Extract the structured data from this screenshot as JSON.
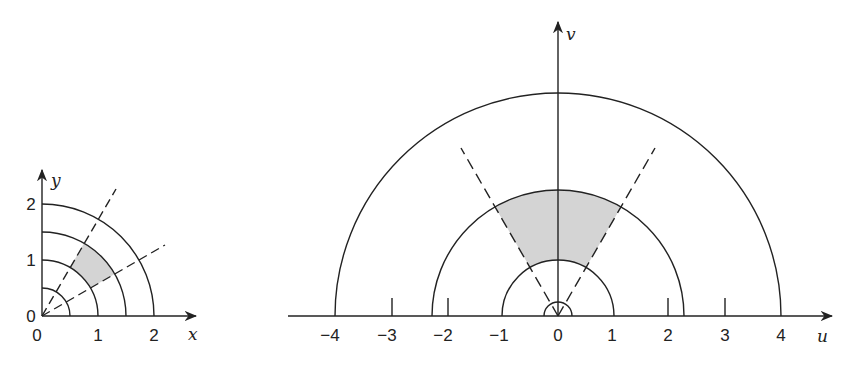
{
  "left_figure": {
    "x_axis_label": "x",
    "y_axis_label": "y",
    "x_ticks": [
      "0",
      "1",
      "2"
    ],
    "y_ticks": [
      "0",
      "1",
      "2"
    ],
    "circle_radii": [
      0.5,
      1,
      1.5,
      2
    ],
    "dashed_ray_angles_deg": [
      30,
      60
    ],
    "shaded_region": {
      "r_min": 1,
      "r_max": 1.5,
      "theta_min_deg": 30,
      "theta_max_deg": 60
    }
  },
  "right_figure": {
    "x_axis_label": "u",
    "y_axis_label": "v",
    "x_ticks": [
      "−4",
      "−3",
      "−2",
      "−1",
      "0",
      "1",
      "2",
      "3",
      "4"
    ],
    "semicircle_radii": [
      0.25,
      1,
      2.25,
      4
    ],
    "dashed_ray_angles_deg": [
      60,
      120
    ],
    "shaded_region": {
      "r_min": 1,
      "r_max": 2.25,
      "theta_min_deg": 60,
      "theta_max_deg": 120
    }
  },
  "colors": {
    "stroke": "#222222",
    "shade": "#d4d4d4",
    "background": "#ffffff"
  }
}
